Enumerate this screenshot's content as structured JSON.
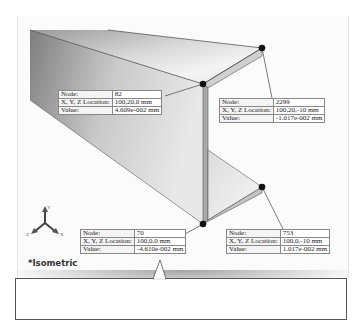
{
  "view": {
    "orientation_label": "*Isometric",
    "triad_axes": [
      "Y",
      "Z",
      "X"
    ]
  },
  "probes": [
    {
      "node_label": "Node:",
      "node": "82",
      "location_label": "X, Y, Z Location:",
      "location": "100,20,0 mm",
      "value_label": "Value:",
      "value": "4.609e-002 mm"
    },
    {
      "node_label": "Node:",
      "node": "2299",
      "location_label": "X, Y, Z Location:",
      "location": "100,20,-10 mm",
      "value_label": "Value:",
      "value": "-1.017e-002 mm"
    },
    {
      "node_label": "Node:",
      "node": "70",
      "location_label": "X, Y, Z Location:",
      "location": "100,0,0 mm",
      "value_label": "Value:",
      "value": "-4.610e-002 mm"
    },
    {
      "node_label": "Node:",
      "node": "753",
      "location_label": "X, Y, Z Location:",
      "location": "100,0,-10 mm",
      "value_label": "Value:",
      "value": "1.017e-002 mm"
    }
  ],
  "colors": {
    "beam_light": "#f2f2f2",
    "beam_dark": "#8a8a8a",
    "node_dot": "#111111",
    "leader": "#444444"
  }
}
